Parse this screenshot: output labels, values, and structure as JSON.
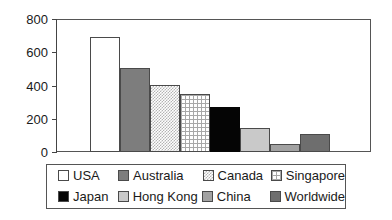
{
  "chart_data": {
    "type": "bar",
    "title": "",
    "subtitle": "",
    "xlabel": "",
    "ylabel": "",
    "categories": [
      "USA",
      "Australia",
      "Canada",
      "Singapore",
      "Japan",
      "Hong Kong",
      "China",
      "Worldwide"
    ],
    "values": [
      690,
      505,
      403,
      349,
      271,
      144,
      48,
      108
    ],
    "ylim": [
      0,
      800
    ],
    "yticks": [
      0,
      200,
      400,
      600,
      800
    ],
    "ytick_labels": [
      "0",
      "200",
      "400",
      "600",
      "800"
    ],
    "grid": false,
    "legend_position": "bottom",
    "bar_styles": [
      "white",
      "solid-gray",
      "stipple",
      "grid",
      "black",
      "light-gray",
      "mid-gray",
      "dark-gray"
    ],
    "legend": [
      {
        "label": "USA",
        "style": "white",
        "color": "#ffffff"
      },
      {
        "label": "Australia",
        "style": "solid-gray",
        "color": "#7d7d7d"
      },
      {
        "label": "Canada",
        "style": "stipple",
        "color": "#d8d8d8"
      },
      {
        "label": "Singapore",
        "style": "grid",
        "color": "#f0f0f0"
      },
      {
        "label": "Japan",
        "style": "black",
        "color": "#050505"
      },
      {
        "label": "Hong Kong",
        "style": "light-gray",
        "color": "#c9c9c9"
      },
      {
        "label": "China",
        "style": "mid-gray",
        "color": "#a2a2a2"
      },
      {
        "label": "Worldwide",
        "style": "dark-gray",
        "color": "#6e6e6e"
      }
    ]
  },
  "axis": {
    "tick_0": "0",
    "tick_1": "200",
    "tick_2": "400",
    "tick_3": "600",
    "tick_4": "800"
  },
  "legend_labels": {
    "usa": "USA",
    "australia": "Australia",
    "canada": "Canada",
    "singapore": "Singapore",
    "japan": "Japan",
    "hong_kong": "Hong Kong",
    "china": "China",
    "worldwide": "Worldwide"
  }
}
